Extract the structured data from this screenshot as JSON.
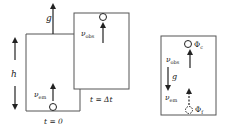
{
  "left_figure": {
    "gravity_label": "g",
    "height_label": "h",
    "emitter_label": "ν",
    "emitter_sub": "em",
    "observer_label": "ν",
    "observer_sub": "obs",
    "time_start_label": "t = 0",
    "time_later_label": "t = Δt"
  },
  "right_figure": {
    "observer_label": "ν",
    "observer_sub": "obs",
    "gravity_label": "g",
    "emitter_label": "ν",
    "emitter_sub": "em",
    "potential_top_label": "Φ",
    "potential_top_sub": "c",
    "potential_bottom_label": "Φ",
    "potential_bottom_sub": "f"
  },
  "colors": {
    "line": "#555555",
    "arrow": "#222222",
    "text": "#222222"
  }
}
